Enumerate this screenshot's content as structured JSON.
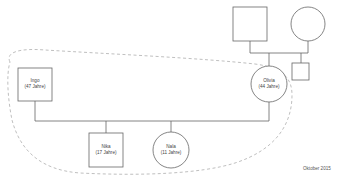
{
  "diagram": {
    "type": "genogram",
    "colors": {
      "line": "#666666",
      "boundary": "#b8b8b8",
      "text": "#444444",
      "background": "#ffffff"
    },
    "persons": [
      {
        "id": "grandfather",
        "shape": "square",
        "name": "",
        "age": ""
      },
      {
        "id": "grandmother",
        "shape": "circle",
        "name": "",
        "age": ""
      },
      {
        "id": "olivia-sibling",
        "shape": "square",
        "name": "",
        "age": ""
      },
      {
        "id": "ingo",
        "shape": "square",
        "name": "Ingo",
        "age": "(47 Jahre)"
      },
      {
        "id": "olivia",
        "shape": "circle",
        "name": "Olivia",
        "age": "(44 Jahre)"
      },
      {
        "id": "nika",
        "shape": "square",
        "name": "Nika",
        "age": "(17 Jahre)"
      },
      {
        "id": "nala",
        "shape": "circle",
        "name": "Nala",
        "age": "(11 Jahre)"
      }
    ],
    "household_boundary": "dashed",
    "date": "Oktober 2015"
  }
}
